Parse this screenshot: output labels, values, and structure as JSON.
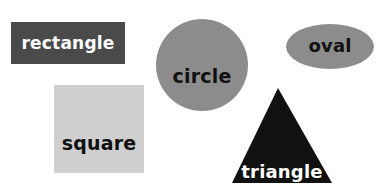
{
  "scene": {
    "title": "Basic Shapes",
    "background_color": "#ffffff",
    "width": 390,
    "height": 188
  },
  "shapes": [
    {
      "id": "rectangle",
      "label": "rectangle",
      "kind": "rectangle",
      "fill_color": "#4a4a4a",
      "text_color": "#ffffff",
      "x": 11,
      "y": 22,
      "width": 114,
      "height": 42
    },
    {
      "id": "circle",
      "label": "circle",
      "kind": "circle",
      "fill_color": "#8c8c8c",
      "text_color": "#111111",
      "x": 156,
      "y": 19,
      "width": 92,
      "height": 92
    },
    {
      "id": "oval",
      "label": "oval",
      "kind": "ellipse",
      "fill_color": "#8c8c8c",
      "text_color": "#111111",
      "x": 286,
      "y": 24,
      "width": 88,
      "height": 45
    },
    {
      "id": "square",
      "label": "square",
      "kind": "square",
      "fill_color": "#cfcfcf",
      "text_color": "#111111",
      "x": 54,
      "y": 85,
      "width": 90,
      "height": 88
    },
    {
      "id": "triangle",
      "label": "triangle",
      "kind": "triangle",
      "fill_color": "#111111",
      "text_color": "#ffffff",
      "x": 232,
      "y": 88,
      "width": 100,
      "height": 95
    }
  ]
}
